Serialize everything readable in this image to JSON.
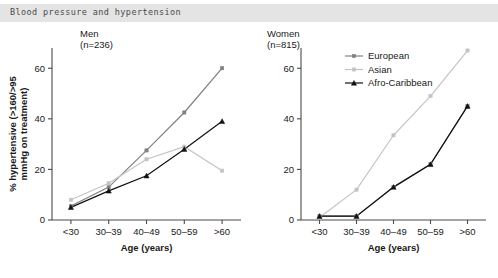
{
  "header": {
    "title": "Blood pressure and hypertension"
  },
  "panels": {
    "men": {
      "name": "Men",
      "n": "(n=236)"
    },
    "women": {
      "name": "Women",
      "n": "(n=815)"
    }
  },
  "legend": {
    "position": "top-left-of-women-panel",
    "entries": [
      {
        "label": "European",
        "color": "#808080",
        "marker": "square"
      },
      {
        "label": "Asian",
        "color": "#c4c4c4",
        "marker": "square"
      },
      {
        "label": "Afro-Caribbean",
        "color": "#111111",
        "marker": "triangle"
      }
    ]
  },
  "axis": {
    "xlabel": "Age (years)",
    "ylabel_line1": "% hypertensive (>160/>95",
    "ylabel_line2": "mmHg on treatment)",
    "yticks": [
      "0",
      "20",
      "40",
      "60"
    ],
    "xticks": [
      "<30",
      "30–39",
      "40–49",
      "50–59",
      ">60"
    ]
  },
  "chart_data": [
    {
      "type": "line",
      "title": "Men",
      "subtitle": "(n=236)",
      "xlabel": "Age (years)",
      "ylabel": "% hypertensive (>160/>95 mmHg on treatment)",
      "categories": [
        "<30",
        "30–39",
        "40–49",
        "50–59",
        ">60"
      ],
      "ylim": [
        0,
        68
      ],
      "yticks": [
        0,
        20,
        40,
        60
      ],
      "grid": false,
      "legend": false,
      "series": [
        {
          "name": "European",
          "color": "#808080",
          "values": [
            5.5,
            13.0,
            27.5,
            42.5,
            60.0
          ]
        },
        {
          "name": "Asian",
          "color": "#c4c4c4",
          "values": [
            8.0,
            14.5,
            24.0,
            29.0,
            19.5
          ]
        },
        {
          "name": "Afro-Caribbean",
          "color": "#111111",
          "values": [
            5.0,
            11.5,
            17.5,
            28.0,
            39.0
          ]
        }
      ]
    },
    {
      "type": "line",
      "title": "Women",
      "subtitle": "(n=815)",
      "xlabel": "Age (years)",
      "ylabel": "% hypertensive (>160/>95 mmHg on treatment)",
      "categories": [
        "<30",
        "30–39",
        "40–49",
        "50–59",
        ">60"
      ],
      "ylim": [
        0,
        68
      ],
      "yticks": [
        0,
        20,
        40,
        60
      ],
      "grid": false,
      "legend": true,
      "series": [
        {
          "name": "European",
          "color": "#808080",
          "values": [
            1.5,
            1.5,
            13.0,
            22.0,
            45.0
          ]
        },
        {
          "name": "Asian",
          "color": "#c4c4c4",
          "values": [
            1.0,
            12.0,
            33.5,
            49.0,
            67.0
          ]
        },
        {
          "name": "Afro-Caribbean",
          "color": "#111111",
          "values": [
            1.5,
            1.5,
            13.0,
            22.0,
            45.0
          ]
        }
      ]
    }
  ]
}
